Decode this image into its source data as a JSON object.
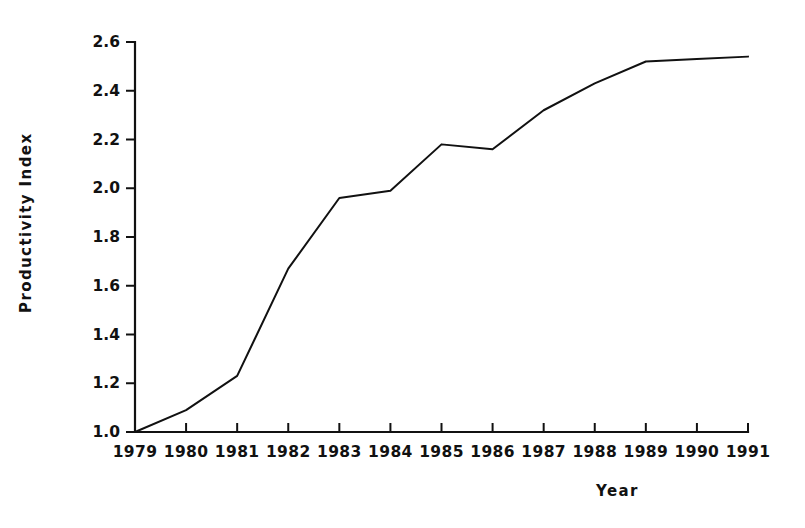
{
  "figure": {
    "background_color": "#ffffff",
    "ink_color": "#111111"
  },
  "axes": {
    "y_title": "Productivity Index",
    "x_title": "Year"
  },
  "chart_data": {
    "type": "line",
    "title": "",
    "subtitle": "",
    "xlabel": "Year",
    "ylabel": "Productivity Index",
    "categories": [
      "1979",
      "1980",
      "1981",
      "1982",
      "1983",
      "1984",
      "1985",
      "1986",
      "1987",
      "1988",
      "1989",
      "1990",
      "1991"
    ],
    "x": [
      1979,
      1980,
      1981,
      1982,
      1983,
      1984,
      1985,
      1986,
      1987,
      1988,
      1989,
      1990,
      1991
    ],
    "values": [
      1.0,
      1.09,
      1.23,
      1.67,
      1.96,
      1.99,
      2.18,
      2.16,
      2.32,
      2.43,
      2.52,
      2.53,
      2.54
    ],
    "series": [
      {
        "name": "Productivity Index",
        "values": [
          1.0,
          1.09,
          1.23,
          1.67,
          1.96,
          1.99,
          2.18,
          2.16,
          2.32,
          2.43,
          2.52,
          2.53,
          2.54
        ],
        "color": "#111111",
        "line_width": 2
      }
    ],
    "xlim": [
      1979,
      1991
    ],
    "ylim": [
      1.0,
      2.6
    ],
    "y_ticks": [
      1.0,
      1.2,
      1.4,
      1.6,
      1.8,
      2.0,
      2.2,
      2.4,
      2.6
    ],
    "y_tick_labels": [
      "1.0",
      "1.2",
      "1.4",
      "1.6",
      "1.8",
      "2.0",
      "2.2",
      "2.4",
      "2.6"
    ],
    "x_ticks": [
      1979,
      1980,
      1981,
      1982,
      1983,
      1984,
      1985,
      1986,
      1987,
      1988,
      1989,
      1990,
      1991
    ],
    "x_tick_labels": [
      "1979",
      "1980",
      "1981",
      "1982",
      "1983",
      "1984",
      "1985",
      "1986",
      "1987",
      "1988",
      "1989",
      "1990",
      "1991"
    ],
    "grid": false,
    "legend": null,
    "legend_position": "none",
    "annotations": [],
    "spines": [
      "left",
      "bottom"
    ],
    "tick_direction": "out"
  },
  "y_tick_labels": [
    {
      "text": "2.6"
    },
    {
      "text": "2.4"
    },
    {
      "text": "2.2"
    },
    {
      "text": "2.0"
    },
    {
      "text": "1.8"
    },
    {
      "text": "1.6"
    },
    {
      "text": "1.4"
    },
    {
      "text": "1.2"
    },
    {
      "text": "1.0"
    }
  ],
  "x_tick_labels": [
    {
      "text": "1979"
    },
    {
      "text": "1980"
    },
    {
      "text": "1981"
    },
    {
      "text": "1982"
    },
    {
      "text": "1983"
    },
    {
      "text": "1984"
    },
    {
      "text": "1985"
    },
    {
      "text": "1986"
    },
    {
      "text": "1987"
    },
    {
      "text": "1988"
    },
    {
      "text": "1989"
    },
    {
      "text": "1990"
    },
    {
      "text": "1991"
    }
  ]
}
